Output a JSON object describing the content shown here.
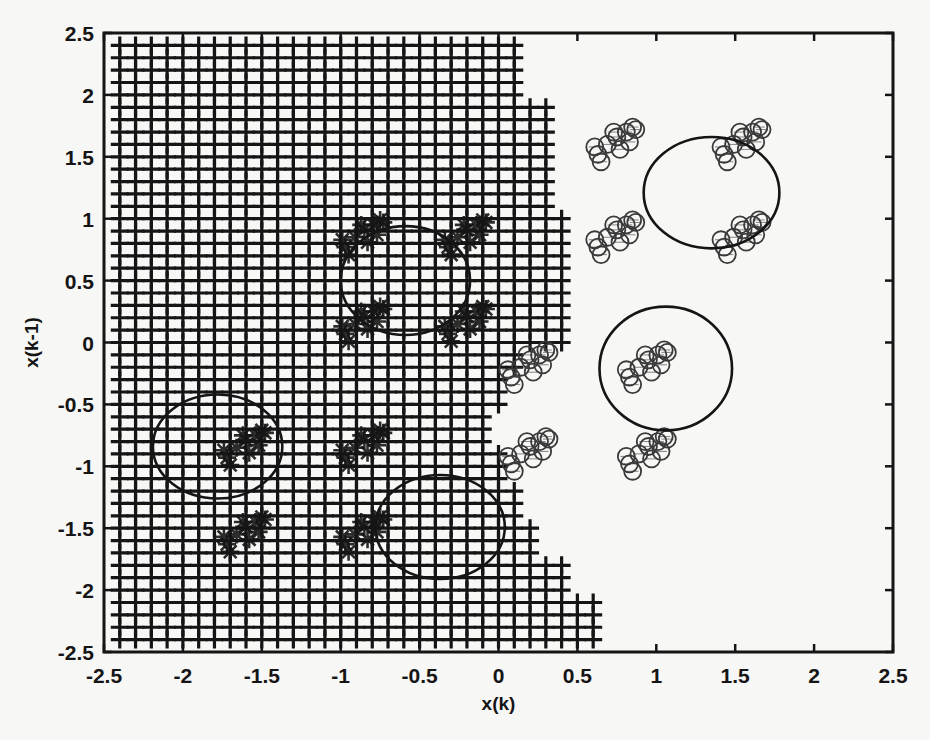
{
  "chart_data": {
    "type": "scatter",
    "title": "",
    "xlabel": "x(k)",
    "ylabel": "x(k-1)",
    "xlim": [
      -2.5,
      2.5
    ],
    "ylim": [
      -2.5,
      2.5
    ],
    "xticks": [
      -2.5,
      -2,
      -1.5,
      -1,
      -0.5,
      0,
      0.5,
      1,
      1.5,
      2,
      2.5
    ],
    "yticks": [
      -2.5,
      -2,
      -1.5,
      -1,
      -0.5,
      0,
      0.5,
      1,
      1.5,
      2,
      2.5
    ],
    "xtick_labels": [
      "-2.5",
      "-2",
      "-1.5",
      "-1",
      "-0.5",
      "0",
      "0.5",
      "1",
      "1.5",
      "2",
      "2.5"
    ],
    "ytick_labels": [
      "-2.5",
      "-2",
      "-1.5",
      "-1",
      "-0.5",
      "0",
      "0.5",
      "1",
      "1.5",
      "2",
      "2.5"
    ],
    "grid": false,
    "legend": null,
    "series": [
      {
        "name": "grid points",
        "marker": "+",
        "description": "Regular grid of '+' markers, spacing 0.1, filling the left region with a staircase right boundary",
        "x_start": -2.4,
        "step": 0.1,
        "y_rows_from": -2.4,
        "y_rows_to": 2.4,
        "right_boundary": [
          {
            "y_min": 2.0,
            "y_max": 2.4,
            "x_max": 0.1
          },
          {
            "y_min": 1.1,
            "y_max": 1.9,
            "x_max": 0.3
          },
          {
            "y_min": 0.0,
            "y_max": 1.0,
            "x_max": 0.4
          },
          {
            "y_min": -0.2,
            "y_max": -0.1,
            "x_max": 0.1
          },
          {
            "y_min": -0.5,
            "y_max": -0.3,
            "x_max": 0.0
          },
          {
            "y_min": -0.8,
            "y_max": -0.6,
            "x_max": -0.1
          },
          {
            "y_min": -1.1,
            "y_max": -0.9,
            "x_max": 0.0
          },
          {
            "y_min": -1.4,
            "y_max": -1.2,
            "x_max": 0.1
          },
          {
            "y_min": -1.7,
            "y_max": -1.5,
            "x_max": 0.2
          },
          {
            "y_min": -2.0,
            "y_max": -1.8,
            "x_max": 0.4
          },
          {
            "y_min": -2.4,
            "y_max": -2.1,
            "x_max": 0.6
          }
        ]
      },
      {
        "name": "class A clusters",
        "marker": "*",
        "clusters": [
          {
            "x": -0.85,
            "y": 0.85
          },
          {
            "x": -0.2,
            "y": 0.85
          },
          {
            "x": -0.85,
            "y": 0.15
          },
          {
            "x": -0.2,
            "y": 0.15
          },
          {
            "x": -1.6,
            "y": -0.85
          },
          {
            "x": -0.85,
            "y": -0.85
          },
          {
            "x": -1.6,
            "y": -1.55
          },
          {
            "x": -0.85,
            "y": -1.55
          }
        ]
      },
      {
        "name": "class B clusters",
        "marker": "o",
        "clusters": [
          {
            "x": 0.75,
            "y": 1.6
          },
          {
            "x": 1.55,
            "y": 1.6
          },
          {
            "x": 0.75,
            "y": 0.85
          },
          {
            "x": 1.55,
            "y": 0.85
          },
          {
            "x": 0.2,
            "y": -0.2
          },
          {
            "x": 0.95,
            "y": -0.2
          },
          {
            "x": 0.2,
            "y": -0.9
          },
          {
            "x": 0.95,
            "y": -0.9
          }
        ]
      }
    ],
    "circles": [
      {
        "cx": -0.59,
        "cy": 0.5,
        "rx": 0.41,
        "ry": 0.44
      },
      {
        "cx": -1.78,
        "cy": -0.84,
        "rx": 0.41,
        "ry": 0.42
      },
      {
        "cx": -0.37,
        "cy": -1.49,
        "rx": 0.41,
        "ry": 0.42
      },
      {
        "cx": 1.35,
        "cy": 1.21,
        "rx": 0.43,
        "ry": 0.45
      },
      {
        "cx": 1.06,
        "cy": -0.21,
        "rx": 0.42,
        "ry": 0.5
      }
    ]
  },
  "plot_area": {
    "left": 104,
    "top": 33,
    "right": 893,
    "bottom": 652
  },
  "colors": {
    "ink": "#151515",
    "marker_o": "#3a3a3a",
    "background": "#f7f7f5"
  }
}
